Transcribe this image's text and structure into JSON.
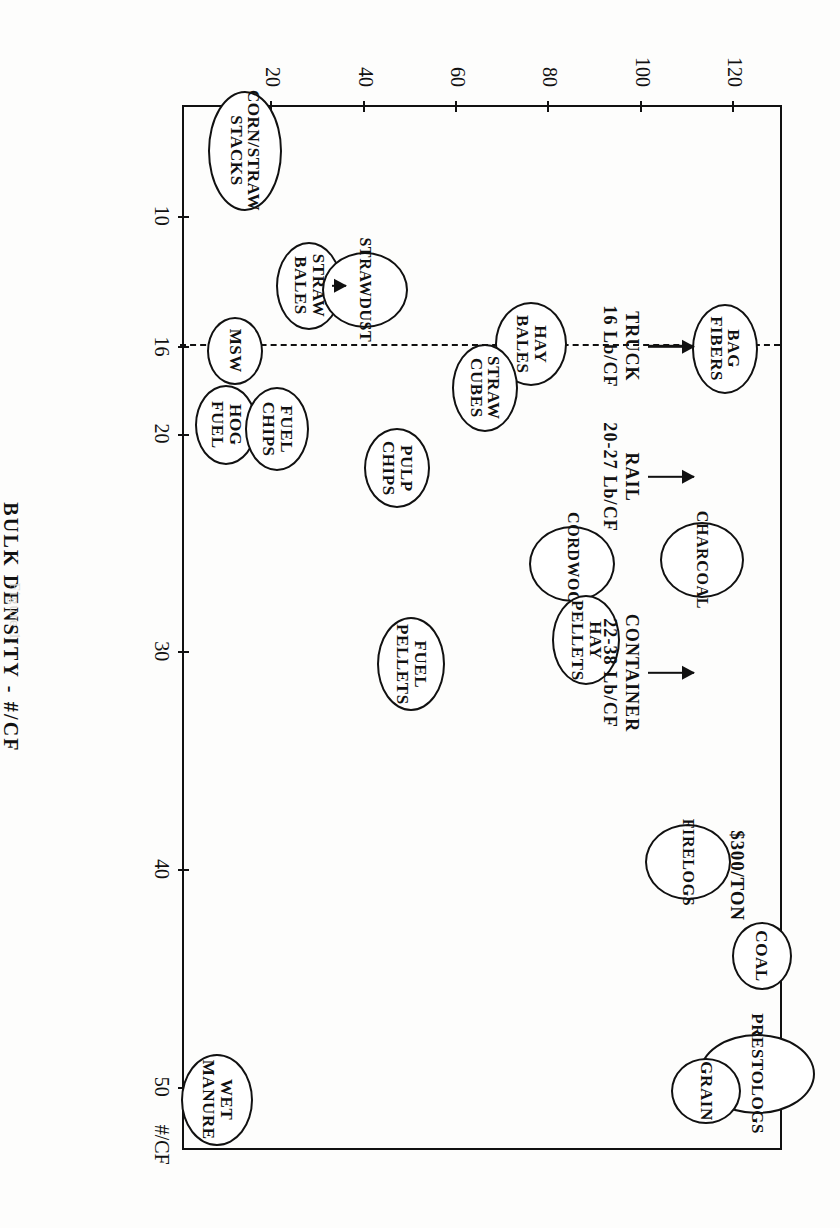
{
  "figure": {
    "caption": "Figure 1."
  },
  "chart_data": {
    "type": "scatter",
    "title": "",
    "xlabel": "BULK DENSITY - #/CF",
    "ylabel": "PRODUCT VALUE  $/TON",
    "xlim": [
      5,
      53
    ],
    "ylim": [
      0,
      130
    ],
    "grid": false,
    "legend": "none",
    "xticks": [
      10,
      16,
      20,
      30,
      40,
      50
    ],
    "xticklabels": [
      "10",
      "16",
      "20",
      "30",
      "40",
      "50"
    ],
    "yticks": [
      20,
      40,
      60,
      80,
      100,
      120
    ],
    "yticklabels": [
      "20",
      "40",
      "60",
      "80",
      "100",
      "120"
    ],
    "xaxis_unit_suffix": "#/CF",
    "points": [
      {
        "label": "CORN/STRAW\nSTACKS",
        "x": 7.0,
        "y": 14,
        "rx": 60,
        "ry": 37,
        "fs": 17
      },
      {
        "label": "STRAW\nBALES",
        "x": 13.2,
        "y": 28,
        "rx": 44,
        "ry": 33,
        "fs": 17
      },
      {
        "label": "STRAWDUST",
        "x": 13.4,
        "y": 40,
        "rx": 38,
        "ry": 43,
        "fs": 16
      },
      {
        "label": "MSW",
        "x": 16.2,
        "y": 12,
        "rx": 34,
        "ry": 28,
        "fs": 17
      },
      {
        "label": "HAY\nBALES",
        "x": 15.9,
        "y": 76,
        "rx": 42,
        "ry": 36,
        "fs": 17
      },
      {
        "label": "HOG\nFUEL",
        "x": 19.6,
        "y": 10,
        "rx": 40,
        "ry": 31,
        "fs": 17
      },
      {
        "label": "FUEL\nCHIPS",
        "x": 19.8,
        "y": 21,
        "rx": 42,
        "ry": 32,
        "fs": 17
      },
      {
        "label": "BAG\nFIBERS",
        "x": 16.1,
        "y": 118,
        "rx": 45,
        "ry": 33,
        "fs": 17
      },
      {
        "label": "STRAW\nCUBES",
        "x": 17.9,
        "y": 66,
        "rx": 44,
        "ry": 33,
        "fs": 17
      },
      {
        "label": "PULP\nCHIPS",
        "x": 21.6,
        "y": 47,
        "rx": 40,
        "ry": 33,
        "fs": 17
      },
      {
        "label": "CORDWOOD",
        "x": 26.0,
        "y": 85,
        "rx": 38,
        "ry": 43,
        "fs": 16
      },
      {
        "label": "CHARCOAL",
        "x": 25.8,
        "y": 113,
        "rx": 38,
        "ry": 42,
        "fs": 16
      },
      {
        "label": "HAY\nPELLETS",
        "x": 29.5,
        "y": 88,
        "rx": 45,
        "ry": 34,
        "fs": 17
      },
      {
        "label": "FUEL\nPELLETS",
        "x": 30.6,
        "y": 50,
        "rx": 47,
        "ry": 34,
        "fs": 17
      },
      {
        "label": "FIRELOGS",
        "x": 39.7,
        "y": 110,
        "rx": 38,
        "ry": 43,
        "fs": 16
      },
      {
        "label": "COAL",
        "x": 44.0,
        "y": 126,
        "rx": 34,
        "ry": 30,
        "fs": 17
      },
      {
        "label": "PRESTOLOGS",
        "x": 49.4,
        "y": 125,
        "rx": 40,
        "ry": 58,
        "fs": 17
      },
      {
        "label": "GRAIN",
        "x": 50.2,
        "y": 114,
        "rx": 33,
        "ry": 35,
        "fs": 17
      },
      {
        "label": "WET\nMANURE",
        "x": 50.6,
        "y": 8,
        "rx": 46,
        "ry": 36,
        "fs": 17
      }
    ],
    "reference_line": {
      "value": 16,
      "style": "dashed",
      "orientation": "vertical-in-data-space"
    },
    "annotations": [
      {
        "name": "truck",
        "text": "TRUCK\n16 Lb/CF",
        "x": 16.0,
        "y": 100,
        "arrow": true
      },
      {
        "name": "rail",
        "text": "RAIL\n20-27 Lb/CF",
        "x": 22.0,
        "y": 100,
        "arrow": true
      },
      {
        "name": "container",
        "text": "CONTAINER\n22-38 Lb/CF",
        "x": 31.0,
        "y": 100,
        "arrow": true
      },
      {
        "name": "firelogs-price",
        "text": "$300/TON",
        "x": 40.3,
        "y": 123,
        "arrow": false
      }
    ],
    "straw_bales_arrow": {
      "from_x": 13.2,
      "from_y": 33,
      "to_x": 15.6,
      "to_y": 36,
      "note": "arrow from STRAW BALES marker up to the 16 Lb/CF dashed line"
    }
  }
}
